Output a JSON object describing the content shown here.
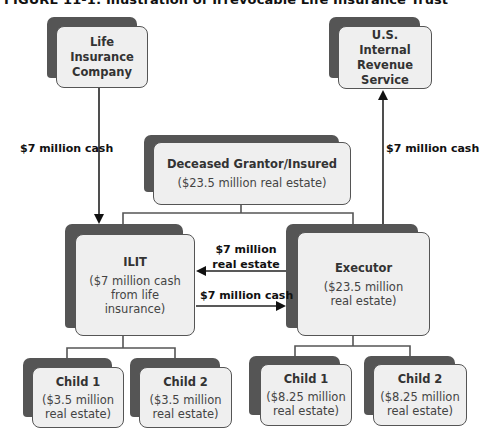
{
  "figure": {
    "title": "FIGURE 11-1: Illustration of Irrevocable Life Insurance Trust"
  },
  "nodes": {
    "life_insurance": {
      "name": "Life Insurance Company"
    },
    "irs": {
      "name": "U.S. Internal Revenue Service"
    },
    "deceased": {
      "name": "Deceased Grantor/Insured",
      "detail": "($23.5 million real estate)"
    },
    "ilit": {
      "name": "ILIT",
      "detail": "($7 million cash from life insurance)"
    },
    "executor": {
      "name": "Executor",
      "detail": "($23.5 million real estate)"
    },
    "ilit_child1": {
      "name": "Child 1",
      "detail": "($3.5 million real estate)"
    },
    "ilit_child2": {
      "name": "Child 2",
      "detail": "($3.5 million real estate)"
    },
    "exec_child1": {
      "name": "Child 1",
      "detail": "($8.25 million real estate)"
    },
    "exec_child2": {
      "name": "Child 2",
      "detail": "($8.25 million real estate)"
    }
  },
  "edges": {
    "insurer_to_ilit": {
      "label": "$7 million cash"
    },
    "executor_to_irs": {
      "label": "$7 million cash"
    },
    "executor_to_ilit": {
      "label_line1": "$7 million",
      "label_line2": "real estate"
    },
    "ilit_to_executor": {
      "label": "$7 million cash"
    }
  },
  "colors": {
    "box_fill": "#efefef",
    "box_border": "#555555",
    "shadow": "#555555",
    "line": "#222222"
  }
}
